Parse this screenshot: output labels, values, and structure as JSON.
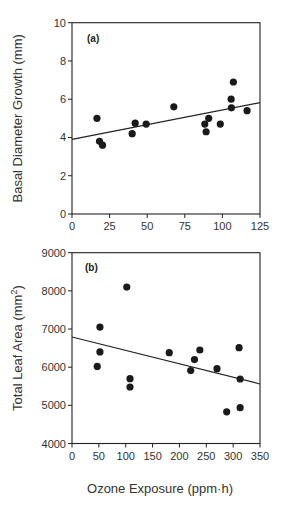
{
  "chart_data": [
    {
      "type": "scatter",
      "panel_label": "(a)",
      "title": "",
      "xlabel": "",
      "ylabel": "Basal Diameter Growth (mm)",
      "xlim": [
        0,
        125
      ],
      "ylim": [
        0,
        10
      ],
      "xticks": [
        0,
        25,
        50,
        75,
        100,
        125
      ],
      "yticks": [
        0,
        2,
        4,
        6,
        8,
        10
      ],
      "grid": false,
      "points": [
        {
          "x": 16.6,
          "y": 5.0
        },
        {
          "x": 18.3,
          "y": 3.8
        },
        {
          "x": 20.3,
          "y": 3.6
        },
        {
          "x": 40.0,
          "y": 4.2
        },
        {
          "x": 42.0,
          "y": 4.75
        },
        {
          "x": 49.3,
          "y": 4.7
        },
        {
          "x": 67.7,
          "y": 5.6
        },
        {
          "x": 88.3,
          "y": 4.7
        },
        {
          "x": 89.2,
          "y": 4.3
        },
        {
          "x": 90.9,
          "y": 5.0
        },
        {
          "x": 98.6,
          "y": 4.7
        },
        {
          "x": 105.8,
          "y": 6.0
        },
        {
          "x": 106.0,
          "y": 5.55
        },
        {
          "x": 107.3,
          "y": 6.9
        },
        {
          "x": 116.4,
          "y": 5.4
        }
      ],
      "trendline": {
        "x": [
          0,
          125
        ],
        "y": [
          3.9,
          5.82
        ]
      }
    },
    {
      "type": "scatter",
      "panel_label": "(b)",
      "title": "",
      "xlabel": "Ozone Exposure (ppm·h)",
      "ylabel": "Total Leaf Area (mm²)",
      "ylabel_base": "Total Leaf Area (mm",
      "ylabel_sup": "2",
      "ylabel_close": ")",
      "xlim": [
        0,
        350
      ],
      "ylim": [
        4000,
        9000
      ],
      "xticks": [
        0,
        50,
        100,
        150,
        200,
        250,
        300,
        350
      ],
      "yticks": [
        4000,
        5000,
        6000,
        7000,
        8000,
        9000
      ],
      "grid": false,
      "points": [
        {
          "x": 47,
          "y": 6020
        },
        {
          "x": 52,
          "y": 7050
        },
        {
          "x": 52,
          "y": 6400
        },
        {
          "x": 102,
          "y": 8100
        },
        {
          "x": 108,
          "y": 5700
        },
        {
          "x": 108,
          "y": 5480
        },
        {
          "x": 181,
          "y": 6380
        },
        {
          "x": 221,
          "y": 5910
        },
        {
          "x": 228,
          "y": 6200
        },
        {
          "x": 238,
          "y": 6450
        },
        {
          "x": 270,
          "y": 5960
        },
        {
          "x": 288,
          "y": 4830
        },
        {
          "x": 311,
          "y": 6510
        },
        {
          "x": 313,
          "y": 5690
        },
        {
          "x": 313,
          "y": 4940
        }
      ],
      "trendline": {
        "x": [
          0,
          350
        ],
        "y": [
          6790,
          5560
        ]
      }
    }
  ],
  "colors": {
    "axis": "#222222",
    "marker": "#1a1a1a",
    "line": "#222222",
    "text": "#333333"
  }
}
